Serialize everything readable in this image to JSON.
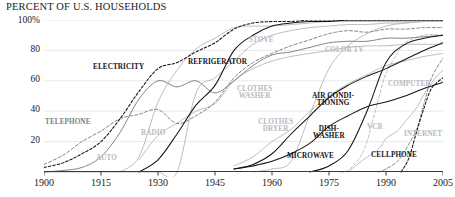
{
  "chart_data": {
    "type": "line",
    "title": "PERCENT OF U.S. HOUSEHOLDS",
    "xlabel": "",
    "ylabel": "",
    "xlim": [
      1900,
      2005
    ],
    "ylim": [
      0,
      100
    ],
    "grid": true,
    "legend_position": "inline-annotations",
    "x_ticks": [
      "1900",
      "1915",
      "1930",
      "1945",
      "1960",
      "1975",
      "1990",
      "2005"
    ],
    "x_tick_values": [
      1900,
      1915,
      1930,
      1945,
      1960,
      1975,
      1990,
      2005
    ],
    "y_ticks": [
      "20",
      "40",
      "60",
      "80",
      "100%"
    ],
    "y_tick_values": [
      20,
      40,
      60,
      80,
      100
    ],
    "series": [
      {
        "name": "STOVE",
        "style": "solid",
        "tone": "pale",
        "x": [
          1900,
          1910,
          1920,
          1925,
          1930,
          1935,
          1940,
          1945,
          1950,
          1955,
          1960,
          1965,
          1970,
          1975,
          1980,
          1985,
          1990,
          1995,
          2000,
          2005
        ],
        "values": [
          0,
          0,
          0,
          0,
          0,
          0,
          52,
          62,
          73,
          84,
          90,
          93,
          95,
          96,
          97,
          97,
          98,
          98,
          99,
          99
        ]
      },
      {
        "name": "ELECTRICITY",
        "style": "dashed",
        "tone": "dark",
        "x": [
          1900,
          1905,
          1910,
          1915,
          1920,
          1925,
          1930,
          1935,
          1940,
          1945,
          1950,
          1955,
          1960,
          1965,
          1970,
          1975,
          1980,
          1985,
          1990,
          1995,
          2000,
          2005
        ],
        "values": [
          3,
          6,
          12,
          20,
          35,
          53,
          68,
          72,
          79,
          85,
          94,
          98,
          99,
          99,
          100,
          100,
          100,
          100,
          100,
          100,
          100,
          100
        ]
      },
      {
        "name": "REFRIGERATOR",
        "style": "solid",
        "tone": "dark",
        "x": [
          1925,
          1930,
          1935,
          1940,
          1945,
          1950,
          1955,
          1960,
          1965,
          1970,
          1975,
          1980,
          1985,
          1990,
          1995,
          2000,
          2005
        ],
        "values": [
          0,
          8,
          25,
          44,
          57,
          80,
          90,
          96,
          98,
          99,
          99,
          100,
          100,
          100,
          100,
          100,
          100
        ]
      },
      {
        "name": "TELEPHONE",
        "style": "dashed",
        "tone": "mid",
        "x": [
          1900,
          1905,
          1910,
          1915,
          1920,
          1925,
          1930,
          1935,
          1940,
          1945,
          1950,
          1955,
          1960,
          1965,
          1970,
          1975,
          1980,
          1985,
          1990,
          1995,
          2000,
          2005
        ],
        "values": [
          5,
          11,
          20,
          27,
          35,
          38,
          41,
          32,
          37,
          46,
          62,
          72,
          78,
          83,
          87,
          91,
          93,
          92,
          94,
          94,
          95,
          95
        ]
      },
      {
        "name": "AUTO",
        "style": "solid",
        "tone": "mid",
        "x": [
          1900,
          1905,
          1910,
          1915,
          1920,
          1925,
          1930,
          1935,
          1940,
          1945,
          1950,
          1955,
          1960,
          1965,
          1970,
          1975,
          1980,
          1985,
          1990,
          1995,
          2000,
          2005
        ],
        "values": [
          0,
          1,
          3,
          10,
          26,
          48,
          60,
          56,
          60,
          52,
          60,
          70,
          77,
          79,
          82,
          85,
          86,
          86,
          88,
          88,
          89,
          90
        ]
      },
      {
        "name": "RADIO",
        "style": "solid",
        "tone": "pale",
        "x": [
          1920,
          1925,
          1930,
          1935,
          1940,
          1945,
          1950,
          1955,
          1960,
          1965,
          1970,
          1975,
          1980,
          1985,
          1990,
          1995,
          2000,
          2005
        ],
        "values": [
          0,
          10,
          46,
          67,
          81,
          88,
          95,
          96,
          96,
          97,
          98,
          99,
          99,
          99,
          99,
          99,
          99,
          99
        ]
      },
      {
        "name": "CLOTHES WASHER",
        "style": "solid",
        "tone": "pale",
        "x": [
          1925,
          1930,
          1935,
          1940,
          1945,
          1950,
          1955,
          1960,
          1965,
          1970,
          1975,
          1980,
          1985,
          1990,
          1995,
          2000,
          2005
        ],
        "values": [
          8,
          24,
          32,
          40,
          45,
          60,
          68,
          73,
          76,
          78,
          80,
          82,
          83,
          83,
          84,
          84,
          84
        ]
      },
      {
        "name": "COLOR TV",
        "style": "solid",
        "tone": "pale",
        "x": [
          1955,
          1960,
          1965,
          1970,
          1975,
          1980,
          1985,
          1990,
          1995,
          2000,
          2005
        ],
        "values": [
          0,
          2,
          7,
          38,
          68,
          83,
          91,
          96,
          98,
          99,
          99
        ]
      },
      {
        "name": "CLOTHES DRYER",
        "style": "solid",
        "tone": "pale",
        "x": [
          1950,
          1955,
          1960,
          1965,
          1970,
          1975,
          1980,
          1985,
          1990,
          1995,
          2000,
          2005
        ],
        "values": [
          4,
          10,
          20,
          28,
          40,
          50,
          58,
          64,
          70,
          73,
          76,
          78
        ]
      },
      {
        "name": "AIR CONDITIONING",
        "style": "solid",
        "tone": "dark",
        "x": [
          1950,
          1955,
          1960,
          1965,
          1970,
          1975,
          1980,
          1985,
          1990,
          1995,
          2000,
          2005
        ],
        "values": [
          2,
          5,
          12,
          25,
          37,
          49,
          57,
          63,
          68,
          74,
          80,
          85
        ]
      },
      {
        "name": "DISHWASHER",
        "style": "solid",
        "tone": "dark",
        "x": [
          1950,
          1955,
          1960,
          1965,
          1970,
          1975,
          1980,
          1985,
          1990,
          1995,
          2000,
          2005
        ],
        "values": [
          2,
          4,
          7,
          12,
          19,
          30,
          37,
          43,
          46,
          50,
          55,
          59
        ]
      },
      {
        "name": "MICROWAVE",
        "style": "solid",
        "tone": "dark",
        "x": [
          1970,
          1975,
          1980,
          1985,
          1990,
          1995,
          2000,
          2005
        ],
        "values": [
          0,
          4,
          14,
          40,
          72,
          84,
          88,
          90
        ]
      },
      {
        "name": "VCR",
        "style": "dashed",
        "tone": "pale",
        "x": [
          1978,
          1980,
          1983,
          1985,
          1988,
          1990,
          1993,
          1995,
          2000,
          2005
        ],
        "values": [
          0,
          1,
          9,
          20,
          48,
          65,
          78,
          85,
          90,
          90
        ]
      },
      {
        "name": "CELLPHONE",
        "style": "dashed",
        "tone": "mid",
        "x": [
          1988,
          1990,
          1993,
          1995,
          1998,
          2000,
          2002,
          2005
        ],
        "values": [
          0,
          2,
          7,
          14,
          28,
          45,
          62,
          75
        ]
      },
      {
        "name": "COMPUTER",
        "style": "solid",
        "tone": "pale",
        "x": [
          1980,
          1984,
          1988,
          1990,
          1993,
          1995,
          1998,
          2000,
          2003,
          2005
        ],
        "values": [
          0,
          8,
          15,
          22,
          27,
          33,
          42,
          51,
          62,
          67
        ]
      },
      {
        "name": "INTERNET",
        "style": "dashed",
        "tone": "dark",
        "x": [
          1994,
          1996,
          1998,
          2000,
          2002,
          2005
        ],
        "values": [
          0,
          9,
          26,
          42,
          55,
          62
        ]
      }
    ],
    "annotations": [
      {
        "id": "electricity",
        "text": "ELECTRICITY",
        "tone": "dark"
      },
      {
        "id": "refrigerator",
        "text": "REFRIGERATOR",
        "tone": "dark"
      },
      {
        "id": "stove",
        "text": "STOVE",
        "tone": "pale"
      },
      {
        "id": "colortv",
        "text": "COLOR TV",
        "tone": "pale"
      },
      {
        "id": "telephone",
        "text": "TELEPHONE",
        "tone": "mid"
      },
      {
        "id": "auto",
        "text": "AUTO",
        "tone": "pale"
      },
      {
        "id": "radio",
        "text": "RADIO",
        "tone": "pale"
      },
      {
        "id": "clotheswasher",
        "text": "CLOTHES\nWASHER",
        "tone": "pale"
      },
      {
        "id": "clothesdryer",
        "text": "CLOTHES\nDRYER",
        "tone": "pale"
      },
      {
        "id": "aircon",
        "text": "AIR CONDI-\nTIONING",
        "tone": "dark"
      },
      {
        "id": "dishwasher",
        "text": "DISH-\nWASHER",
        "tone": "dark"
      },
      {
        "id": "microwave",
        "text": "MICROWAVE",
        "tone": "dark"
      },
      {
        "id": "vcr",
        "text": "VCR",
        "tone": "pale"
      },
      {
        "id": "cellphone",
        "text": "CELLPHONE",
        "tone": "dark"
      },
      {
        "id": "computer",
        "text": "COMPUTER",
        "tone": "pale"
      },
      {
        "id": "internet",
        "text": "INTERNET",
        "tone": "pale"
      }
    ],
    "colors": {
      "dark": "#15151a",
      "mid": "#7d7d83",
      "pale": "#b9b9bf",
      "axis": "#3a3a3a",
      "grid": "#e9e9ec",
      "background": "#ffffff"
    }
  }
}
